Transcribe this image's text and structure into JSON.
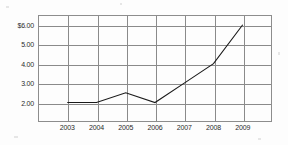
{
  "chart_data": {
    "type": "line",
    "title": "",
    "xlabel": "",
    "ylabel": "",
    "categories": [
      "2003",
      "2004",
      "2005",
      "2006",
      "2007",
      "2008",
      "2009"
    ],
    "values": [
      2.0,
      2.0,
      2.5,
      2.0,
      3.0,
      4.0,
      6.0
    ],
    "series": [
      {
        "name": "",
        "values": [
          2.0,
          2.0,
          2.5,
          2.0,
          3.0,
          4.0,
          6.0
        ]
      }
    ],
    "ylim": [
      1.0,
      6.5
    ],
    "ytick_values": [
      6.0,
      5.0,
      4.0,
      3.0,
      2.0
    ],
    "ytick_labels": [
      "$6.00",
      "5.00",
      "4.00",
      "3.00",
      "2.00"
    ],
    "xtick_labels": [
      "2003",
      "2004",
      "2005",
      "2006",
      "2007",
      "2008",
      "2009"
    ],
    "grid": true,
    "legend": "none",
    "line_color": "#1a1a1a",
    "grid_color": "#8a8a8a",
    "background_color": "#fdfdfd"
  }
}
